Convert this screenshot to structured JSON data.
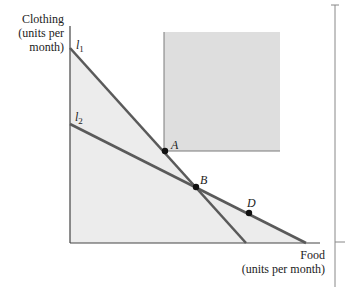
{
  "axes": {
    "y_label_lines": [
      "Clothing",
      "(units per",
      "month)"
    ],
    "x_label_lines": [
      "Food",
      "(units per month)"
    ]
  },
  "lines": [
    {
      "name": "l",
      "subscript": "1",
      "start": [
        70,
        48
      ],
      "end": [
        246,
        243
      ]
    },
    {
      "name": "l",
      "subscript": "2",
      "start": [
        70,
        124
      ],
      "end": [
        306,
        243
      ]
    }
  ],
  "points": [
    {
      "label": "A",
      "x": 165,
      "y": 151
    },
    {
      "label": "B",
      "x": 196,
      "y": 187
    },
    {
      "label": "D",
      "x": 249,
      "y": 213
    }
  ],
  "region": {
    "x": 164,
    "y": 32,
    "width": 116,
    "height": 119
  },
  "colors": {
    "line": "#5a5a5a",
    "fill": "#ececec",
    "region": "#dedede",
    "axis": "#444444",
    "point": "#111111"
  }
}
